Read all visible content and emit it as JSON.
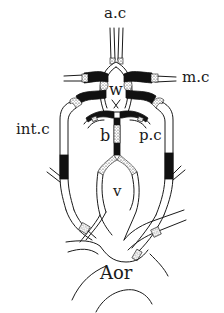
{
  "figure": {
    "labels": {
      "anterior_cerebral": "a.c",
      "middle_cerebral": "m.c",
      "willis_circle": "w",
      "internal_carotid": "int.c",
      "basilar": "b",
      "posterior_cerebral": "p.c",
      "vertebral": "v",
      "aorta": "Aor"
    },
    "fill_legend": {
      "dark_segments": "#111111",
      "stippled_segments": "stippled",
      "vessel_outline": "#1a1a1a"
    }
  }
}
